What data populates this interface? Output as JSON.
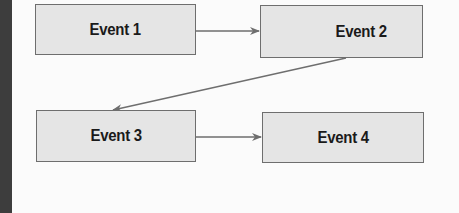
{
  "diagram": {
    "type": "flowchart",
    "nodes": [
      {
        "id": "event1",
        "label": "Event 1"
      },
      {
        "id": "event2",
        "label": "Event 2"
      },
      {
        "id": "event3",
        "label": "Event 3"
      },
      {
        "id": "event4",
        "label": "Event 4"
      }
    ],
    "edges": [
      {
        "from": "event1",
        "to": "event2"
      },
      {
        "from": "event2",
        "to": "event3"
      },
      {
        "from": "event3",
        "to": "event4"
      }
    ],
    "colors": {
      "box_fill": "#e5e5e5",
      "box_border": "#6e6e6e",
      "arrow": "#6e6e6e",
      "side_bar": "#3d3d3d",
      "text": "#1a1a1a"
    }
  }
}
